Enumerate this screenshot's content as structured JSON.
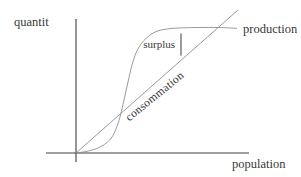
{
  "colors": {
    "axis": "#3f3f3f",
    "curve": "#8f8f8f",
    "arrow": "#3a3a3a",
    "text": "#383838",
    "background": "#ffffff"
  },
  "chart_data": {
    "type": "line",
    "title": "",
    "xlabel": "population",
    "ylabel": "quantit",
    "grid": false,
    "axis_ticks": "none",
    "legend": "inline-labels",
    "axes_px": {
      "origin": [
        76,
        153
      ],
      "x_line": [
        [
          46,
          153
        ],
        [
          249,
          153
        ]
      ],
      "y_line": [
        [
          76,
          162
        ],
        [
          76,
          19
        ]
      ]
    },
    "series": [
      {
        "name": "production",
        "shape": "logistic-s-curve",
        "label_position": "right-of-curve-end",
        "points_px": [
          [
            76,
            153
          ],
          [
            86,
            151.5
          ],
          [
            94,
            149.5
          ],
          [
            101,
            146.5
          ],
          [
            107,
            142.5
          ],
          [
            112,
            137
          ],
          [
            116,
            129
          ],
          [
            120,
            117
          ],
          [
            124,
            100
          ],
          [
            128,
            82
          ],
          [
            132,
            65
          ],
          [
            136,
            53
          ],
          [
            141,
            44
          ],
          [
            147,
            37.5
          ],
          [
            154,
            32.5
          ],
          [
            162,
            29.8
          ],
          [
            172,
            28.4
          ],
          [
            184,
            27.8
          ],
          [
            200,
            27.5
          ],
          [
            218,
            27.5
          ],
          [
            237,
            28.3
          ]
        ]
      },
      {
        "name": "consommation",
        "shape": "straight-line",
        "label_rotation_deg": -39,
        "points_px": [
          [
            76,
            153
          ],
          [
            238,
            10
          ]
        ]
      }
    ],
    "annotations": [
      {
        "label": "surplus",
        "type": "vertical-double-arrow",
        "x_px": 181,
        "y_top_px": 31,
        "y_bottom_px": 58
      }
    ]
  }
}
